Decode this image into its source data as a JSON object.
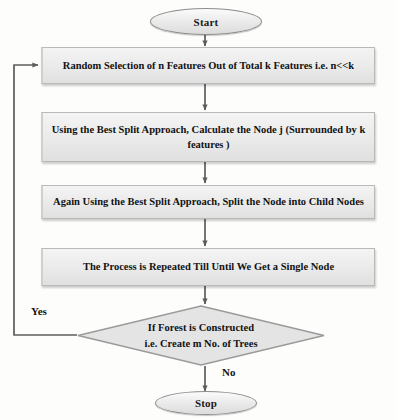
{
  "diagram": {
    "type": "flowchart",
    "colors": {
      "node_fill": "#eaeaea",
      "node_border": "#b9b9b9",
      "edge": "#5d5d5d",
      "text": "#121212",
      "background": "#fdfdfb"
    },
    "nodes": {
      "start": {
        "label": "Start",
        "shape": "oval"
      },
      "step1": {
        "label": "Random Selection of n Features Out of  Total  k Features i.e.  n<<k",
        "shape": "rectangle"
      },
      "step2": {
        "label": "Using the Best Split Approach,  Calculate the Node  j (Surrounded by k features )",
        "shape": "rectangle"
      },
      "step3": {
        "label": "Again Using the Best Split Approach, Split the Node into Child Nodes",
        "shape": "rectangle"
      },
      "step4": {
        "label": "The Process is Repeated Till Until We Get a Single Node",
        "shape": "rectangle"
      },
      "decision": {
        "line1": "If Forest is Constructed",
        "line2": "i.e. Create m No. of Trees",
        "shape": "diamond"
      },
      "stop": {
        "label": "Stop",
        "shape": "oval"
      }
    },
    "edge_labels": {
      "yes": "Yes",
      "no": "No"
    }
  }
}
